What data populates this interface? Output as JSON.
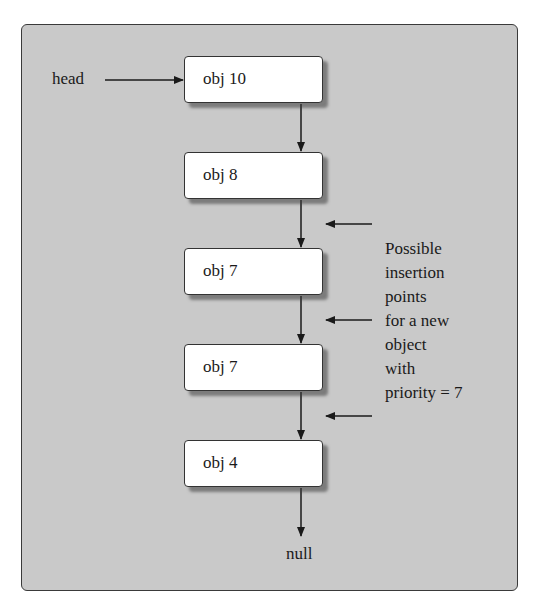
{
  "diagram": {
    "head_label": "head",
    "null_label": "null",
    "nodes": [
      {
        "label": "obj 10"
      },
      {
        "label": "obj 8"
      },
      {
        "label": "obj 7"
      },
      {
        "label": "obj 7"
      },
      {
        "label": "obj 4"
      }
    ],
    "note_lines": [
      "Possible",
      "insertion",
      "points",
      "for a new",
      "object",
      "with",
      "priority = 7"
    ],
    "colors": {
      "panel_bg": "#c9c9c9",
      "node_bg": "#ffffff",
      "line": "#1a1a1a"
    }
  }
}
